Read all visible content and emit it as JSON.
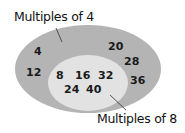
{
  "diagram": {
    "type": "venn-nested",
    "outer_set": {
      "label": "Multiples of 4",
      "color": "#b4b4b4",
      "elements_only_outer": [
        "4",
        "12",
        "20",
        "28",
        "36"
      ]
    },
    "inner_set": {
      "label": "Multiples of 8",
      "color": "#e2e2e2",
      "elements": [
        "8",
        "16",
        "32",
        "24",
        "40"
      ]
    }
  }
}
